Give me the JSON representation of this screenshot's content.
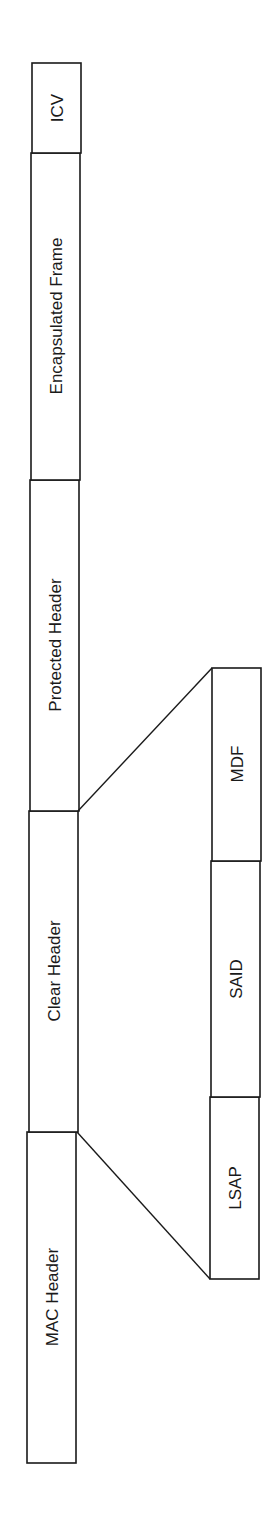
{
  "diagram": {
    "type": "frame-format",
    "orientation": "rotated-90-ccw",
    "frame_fields": [
      {
        "label": "MAC Header"
      },
      {
        "label": "Clear Header"
      },
      {
        "label": "Protected Header"
      },
      {
        "label": "Encapsulated Frame"
      },
      {
        "label": "ICV"
      }
    ],
    "clear_header_expansion": [
      {
        "label": "LSAP"
      },
      {
        "label": "SAID"
      },
      {
        "label": "MDF"
      }
    ],
    "colors": {
      "line": "#1a1a1a",
      "background": "#ffffff"
    }
  }
}
